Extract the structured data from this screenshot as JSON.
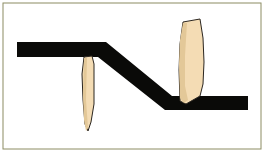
{
  "image": {
    "title": "Stepped black bar with two tapered blades",
    "width": 264,
    "height": 152,
    "background_color": "#ffffff",
    "alt_text": "Line illustration: a thick black Z-shaped bar crossed by two pale tan leaf-shaped blades"
  },
  "frame": {
    "name": "illustration-border",
    "stroke_color": "#8c8c63",
    "stroke_width": 1,
    "fill": "#ffffff",
    "x": 3,
    "y": 3,
    "width": 258,
    "height": 146
  },
  "palette": {
    "black": "#0a0a08",
    "tan": "#f4dcb4",
    "tan_shadow": "#e3c898",
    "outline": "#2b2620",
    "border_olive": "#8c8c63",
    "paper": "#ffffff"
  },
  "shapes": [
    {
      "name": "black-stepped-bar",
      "type": "polygon",
      "fill": "#0a0a08",
      "stroke": "#0a0a08",
      "description": "Thick Z-shaped bar: upper-left horizontal arm, descending diagonal, lower-right horizontal arm",
      "points": "17,42 106,42 172,96 248,96 248,110 165,110 98,57 17,57"
    },
    {
      "name": "left-blade",
      "type": "polygon",
      "fill": "#f4dcb4",
      "stroke": "#2b2620",
      "stroke_width": 1,
      "description": "Narrow tapered blade hanging below the upper-left arm",
      "points": "84,57 92,56 94,64 94,104 91,122 88,131 85,124 83,100 82,74"
    },
    {
      "name": "left-blade-shadow",
      "type": "polygon",
      "fill": "#e3c898",
      "stroke": "none",
      "description": "Inner shading stripe along the left blade",
      "points": "84,58 87,58 86,100 88,128 86,131 84,120 83,96"
    },
    {
      "name": "right-blade",
      "type": "polygon",
      "fill": "#f4dcb4",
      "stroke": "#2b2620",
      "stroke_width": 1,
      "description": "Wide tapered blade rising above the lower-right arm",
      "points": "183,22 200,19 203,38 204,62 203,84 200,96 186,104 180,101 179,70 180,44"
    },
    {
      "name": "right-blade-shadow",
      "type": "polygon",
      "fill": "#e3c898",
      "stroke": "none",
      "description": "Inner shading stripe along the left side of the right blade",
      "points": "183,23 187,23 185,56 185,86 188,100 184,103 180,98 179,64 180,40"
    }
  ],
  "labels": {
    "left_blade": "",
    "right_blade": "",
    "bar": ""
  }
}
